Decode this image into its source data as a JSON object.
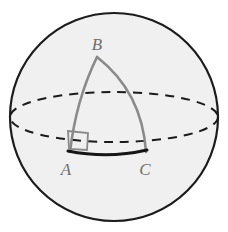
{
  "figure": {
    "kind": "spherical-triangle-diagram",
    "caption": "",
    "width": 228,
    "height": 232,
    "background_color": "#ffffff"
  },
  "sphere": {
    "name": "sphere",
    "center": {
      "x": 114,
      "y": 117
    },
    "radius": 104,
    "fill_color": "#f0f0f0",
    "stroke_color": "#1c1c1c",
    "stroke_width": 2.2
  },
  "equator": {
    "name": "equator-ellipse",
    "center": {
      "x": 114,
      "y": 117
    },
    "rx": 104,
    "ry": 25,
    "stroke_color": "#1a1a1a",
    "stroke_width": 2.0,
    "dash_pattern": "9 7",
    "style": "dashed"
  },
  "triangle": {
    "name": "spherical-triangle-ABC",
    "stroke_color": "#8a8a8a",
    "stroke_width": 2.6,
    "vertices": [
      {
        "id": "A",
        "label": "A",
        "x": 70,
        "y": 152,
        "label_x": 66,
        "label_y": 175
      },
      {
        "id": "B",
        "label": "B",
        "x": 97,
        "y": 57,
        "label_x": 97,
        "label_y": 50
      },
      {
        "id": "C",
        "label": "C",
        "x": 146,
        "y": 152,
        "label_x": 145,
        "label_y": 175
      }
    ],
    "arcs": [
      {
        "id": "AB",
        "name": "arc-A-B",
        "from": "A",
        "to": "B",
        "path": "M 70 152 Q 76 100 97 57",
        "stroke_color": "#8a8a8a",
        "stroke_width": 2.6
      },
      {
        "id": "BC",
        "name": "arc-B-C",
        "from": "B",
        "to": "C",
        "path": "M 97 57 Q 142 92 146 152",
        "stroke_color": "#8a8a8a",
        "stroke_width": 2.6
      },
      {
        "id": "AC",
        "name": "arc-A-C",
        "from": "A",
        "to": "C",
        "path": "M 68 151 Q 108 159 147 150",
        "stroke_color": "#151515",
        "stroke_width": 3.0
      }
    ],
    "right_angle": {
      "name": "right-angle-marker-at-A",
      "at_vertex": "A",
      "path": "M 68 131 L 88 133 L 87 150 L 69 149 Z",
      "stroke_color": "#8a8a8a",
      "stroke_width": 1.8,
      "fill": "none"
    }
  }
}
